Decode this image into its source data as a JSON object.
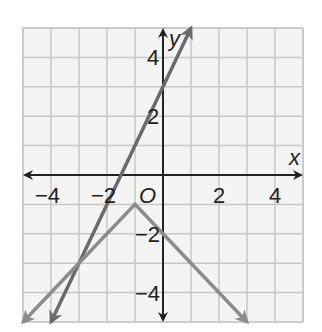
{
  "chart_data": {
    "type": "line",
    "title": "",
    "xlabel": "x",
    "ylabel": "y",
    "origin_label": "O",
    "xlim": [
      -5,
      5
    ],
    "ylim": [
      -5,
      5
    ],
    "grid": true,
    "x_tick_labels": [
      "−4",
      "−2",
      "2",
      "4"
    ],
    "x_tick_values": [
      -4,
      -2,
      2,
      4
    ],
    "y_tick_labels": [
      "4",
      "2",
      "−2",
      "−4"
    ],
    "y_tick_values": [
      4,
      2,
      -2,
      -4
    ],
    "series": [
      {
        "name": "steep line",
        "equation": "y = 2x + 3",
        "points": [
          [
            -4,
            -5
          ],
          [
            0,
            3
          ],
          [
            1,
            5
          ]
        ],
        "color": "#6b6b6b",
        "arrows": "both"
      },
      {
        "name": "absolute value V",
        "equation": "y = -|x + 1| - 1",
        "points": [
          [
            -5,
            -5
          ],
          [
            -1,
            -1
          ],
          [
            0,
            -2
          ],
          [
            3,
            -5
          ]
        ],
        "color": "#8c8c8c",
        "arrows": "both"
      }
    ],
    "intersection": [
      -3,
      -3
    ]
  }
}
